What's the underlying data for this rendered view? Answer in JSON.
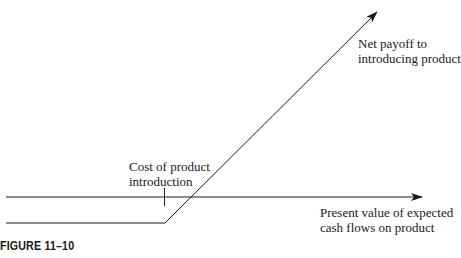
{
  "figure": {
    "caption": "FIGURE 11–10",
    "payoff_label": [
      "Net payoff to",
      "introducing product"
    ],
    "cost_label": [
      "Cost of product",
      "introduction"
    ],
    "axis_label": [
      "Present value of expected",
      "cash flows on product"
    ],
    "colors": {
      "ink": "#1a1a1a",
      "background": "#ffffff"
    }
  }
}
